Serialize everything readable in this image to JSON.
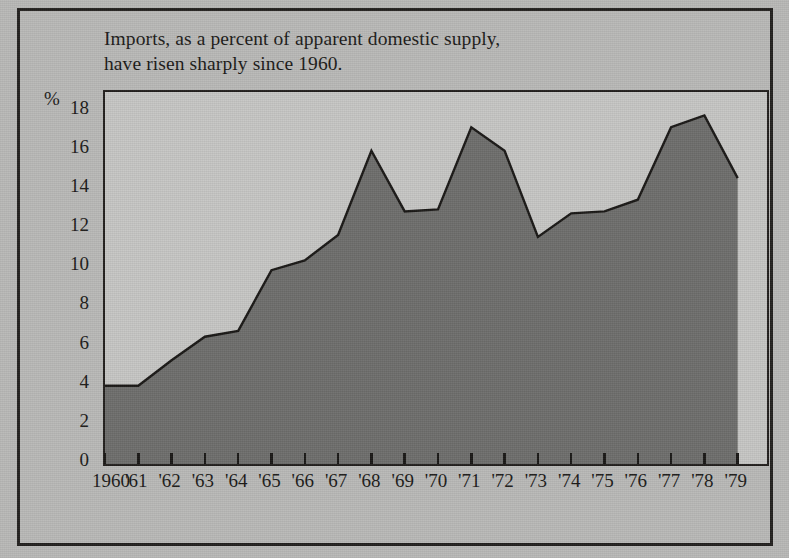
{
  "title": {
    "line1": "Imports, as a percent of apparent domestic supply,",
    "line2": "have risen sharply since 1960."
  },
  "axis": {
    "y_unit_label": "%",
    "y_ticks": [
      "18",
      "16",
      "14",
      "12",
      "10",
      "8",
      "6",
      "4",
      "2",
      "0"
    ],
    "x_ticks": [
      "1960",
      "'61",
      "'62",
      "'63",
      "'64",
      "'65",
      "'66",
      "'67",
      "'68",
      "'69",
      "'70",
      "'71",
      "'72",
      "'73",
      "'74",
      "'75",
      "'76",
      "'77",
      "'78",
      "'79"
    ]
  },
  "colors": {
    "page_background": "#b9b9b7",
    "plot_background": "#c6c6c4",
    "area_fill": "#6e6e6c",
    "line": "#1a1816",
    "frame": "#23211f",
    "text": "#1b1917"
  },
  "chart_data": {
    "type": "area",
    "title": "Imports, as a percent of apparent domestic supply, have risen sharply since 1960.",
    "xlabel": "",
    "ylabel": "%",
    "ylim": [
      0,
      19
    ],
    "xlim": [
      "1960",
      "1979"
    ],
    "grid": false,
    "legend": "none",
    "categories": [
      "1960",
      "1961",
      "1962",
      "1963",
      "1964",
      "1965",
      "1966",
      "1967",
      "1968",
      "1969",
      "1970",
      "1971",
      "1972",
      "1973",
      "1974",
      "1975",
      "1976",
      "1977",
      "1978",
      "1979"
    ],
    "tick_labels": [
      "1960",
      "'61",
      "'62",
      "'63",
      "'64",
      "'65",
      "'66",
      "'67",
      "'68",
      "'69",
      "'70",
      "'71",
      "'72",
      "'73",
      "'74",
      "'75",
      "'76",
      "'77",
      "'78",
      "'79"
    ],
    "values": [
      4.0,
      4.0,
      5.3,
      6.5,
      6.8,
      9.9,
      10.4,
      11.7,
      16.0,
      12.9,
      13.0,
      17.2,
      16.0,
      11.6,
      12.8,
      12.9,
      13.5,
      17.2,
      17.8,
      14.6
    ],
    "series": [
      {
        "name": "Imports as percent of apparent domestic supply",
        "values": [
          4.0,
          4.0,
          5.3,
          6.5,
          6.8,
          9.9,
          10.4,
          11.7,
          16.0,
          12.9,
          13.0,
          17.2,
          16.0,
          11.6,
          12.8,
          12.9,
          13.5,
          17.2,
          17.8,
          14.6
        ]
      }
    ],
    "y_tick_values": [
      18,
      16,
      14,
      12,
      10,
      8,
      6,
      4,
      2,
      0
    ]
  }
}
